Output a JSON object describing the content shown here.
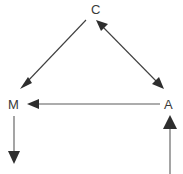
{
  "diagram": {
    "type": "causal-dag",
    "background_color": "#ffffff",
    "edge_color": "#3f3f3f",
    "label_color": "#3a3a3a",
    "nodes": [
      {
        "id": "C",
        "label": "C",
        "x": 96,
        "y": 10,
        "name": "node-c"
      },
      {
        "id": "M",
        "label": "M",
        "x": 14,
        "y": 105,
        "name": "node-m"
      },
      {
        "id": "A",
        "label": "A",
        "x": 169,
        "y": 105,
        "name": "node-a"
      }
    ],
    "edges": [
      {
        "id": "c-to-m",
        "from": "C",
        "to": "M",
        "arrowheads": "end",
        "orientation": "diagonal-down-left",
        "x1": 86,
        "y1": 20,
        "x2": 22,
        "y2": 88
      },
      {
        "id": "c-a-bidirectional",
        "from": "C",
        "to": "A",
        "arrowheads": "both",
        "orientation": "diagonal-down-right",
        "x1": 104,
        "y1": 20,
        "x2": 162,
        "y2": 88
      },
      {
        "id": "a-to-m",
        "from": "A",
        "to": "M",
        "arrowheads": "end",
        "orientation": "horizontal-left",
        "x1": 160,
        "y1": 104,
        "x2": 28,
        "y2": 104
      },
      {
        "id": "m-downward",
        "from": "M",
        "to": "",
        "arrowheads": "end",
        "orientation": "vertical-down",
        "x1": 14,
        "y1": 116,
        "x2": 14,
        "y2": 162
      },
      {
        "id": "into-a-upward",
        "from": "",
        "to": "A",
        "arrowheads": "end",
        "orientation": "vertical-up",
        "x1": 170,
        "y1": 174,
        "x2": 170,
        "y2": 116
      }
    ]
  }
}
